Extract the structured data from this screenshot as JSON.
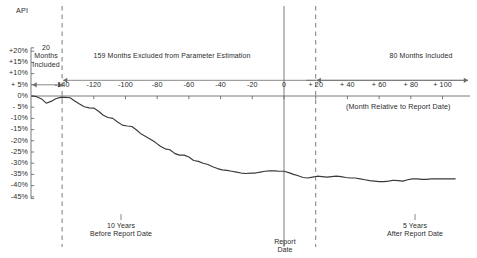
{
  "chart_data": {
    "type": "line",
    "title": "",
    "ylabel": "API",
    "xlabel": "(Month Relative to Report Date)",
    "grid": false,
    "legend_position": "none",
    "xlim": [
      -160,
      110
    ],
    "ylim": [
      -45,
      20
    ],
    "y_tick_labels": [
      "+20%",
      "+15%",
      "+10%",
      "+ 5%",
      "0%",
      "- 5%",
      "-10%",
      "-15%",
      "-20%",
      "-25%",
      "-30%",
      "-35%",
      "-40%",
      "-45%"
    ],
    "y_ticks": [
      20,
      15,
      10,
      5,
      0,
      -5,
      -10,
      -15,
      -20,
      -25,
      -30,
      -35,
      -40,
      -45
    ],
    "x_tick_labels": [
      "-140",
      "-120",
      "-100",
      "-80",
      "-60",
      "-40",
      "-20",
      "0",
      "+ 20",
      "+ 40",
      "+ 60",
      "+ 80",
      "+ 100"
    ],
    "x_ticks": [
      -140,
      -120,
      -100,
      -80,
      -60,
      -40,
      -20,
      0,
      20,
      40,
      60,
      80,
      100
    ],
    "annotations": [
      {
        "name": "months-included-left",
        "text": "20\nMonths\nIncluded",
        "x": -150,
        "y": 8
      },
      {
        "name": "months-excluded",
        "text": "159 Months Excluded from Parameter Estimation",
        "x": -60,
        "y": 7
      },
      {
        "name": "months-included-right",
        "text": "80 Months Included",
        "x": 62,
        "y": 7
      },
      {
        "name": "ten-years-before",
        "text": "10 Years\nBefore Report Date",
        "x": -122,
        "y": -41
      },
      {
        "name": "report-date",
        "text": "Report\nDate",
        "x": 0,
        "y": -46
      },
      {
        "name": "five-years-after",
        "text": "5 Years\nAfter Report Date",
        "x": 44,
        "y": -41
      }
    ],
    "vertical_markers": [
      {
        "name": "estimation-start-boundary",
        "x": -140,
        "style": "dashed"
      },
      {
        "name": "report-date-line",
        "x": 0,
        "style": "solid"
      },
      {
        "name": "estimation-end-boundary",
        "x": 20,
        "style": "dashed"
      }
    ],
    "series": [
      {
        "name": "API",
        "x": [
          -159,
          -156,
          -153,
          -150,
          -147,
          -144,
          -141,
          -138,
          -135,
          -132,
          -129,
          -126,
          -123,
          -120,
          -117,
          -114,
          -111,
          -108,
          -105,
          -102,
          -99,
          -96,
          -93,
          -90,
          -87,
          -84,
          -81,
          -78,
          -75,
          -72,
          -69,
          -66,
          -63,
          -60,
          -57,
          -54,
          -51,
          -48,
          -45,
          -42,
          -39,
          -36,
          -33,
          -30,
          -27,
          -24,
          -21,
          -18,
          -15,
          -12,
          -9,
          -6,
          -3,
          0,
          3,
          6,
          9,
          12,
          15,
          18,
          21,
          24,
          27,
          30,
          33,
          36,
          39,
          42,
          45,
          48,
          51,
          54,
          57,
          60,
          63,
          66,
          69,
          72,
          75,
          78,
          81,
          84,
          87,
          90,
          93,
          96,
          99,
          102,
          105,
          108
        ],
        "y": [
          0.0,
          -0.3,
          -1.3,
          -3.2,
          -2.4,
          -1.2,
          -0.6,
          -0.6,
          -0.8,
          -2.2,
          -3.6,
          -4.8,
          -5.3,
          -5.4,
          -6.8,
          -8.6,
          -9.6,
          -10.0,
          -11.6,
          -13.0,
          -13.4,
          -13.6,
          -15.2,
          -17.0,
          -18.2,
          -19.4,
          -20.8,
          -22.4,
          -23.6,
          -24.0,
          -25.6,
          -26.4,
          -26.4,
          -27.2,
          -28.8,
          -29.2,
          -30.0,
          -30.6,
          -31.6,
          -32.4,
          -33.0,
          -33.2,
          -33.6,
          -34.0,
          -34.4,
          -34.6,
          -34.4,
          -34.4,
          -34.0,
          -33.6,
          -33.4,
          -33.4,
          -33.6,
          -33.6,
          -34.2,
          -35.0,
          -35.6,
          -36.4,
          -36.6,
          -36.2,
          -35.8,
          -36.0,
          -36.2,
          -36.0,
          -35.8,
          -36.0,
          -36.4,
          -36.6,
          -36.6,
          -37.0,
          -37.4,
          -37.8,
          -38.0,
          -38.2,
          -38.2,
          -38.0,
          -37.6,
          -37.8,
          -38.0,
          -37.4,
          -37.0,
          -37.0,
          -37.2,
          -37.2,
          -37.0,
          -37.0,
          -37.0,
          -37.0,
          -37.0,
          -37.0
        ]
      }
    ]
  },
  "labels": {
    "y_axis_title": "API",
    "x_axis_caption": "(Month Relative to Report Date)",
    "note_left_line1": "20",
    "note_left_line2": "Months",
    "note_left_line3": "Included",
    "note_middle": "159 Months Excluded from Parameter Estimation",
    "note_right": "80 Months Included",
    "foot_left_line1": "10 Years",
    "foot_left_line2": "Before Report Date",
    "foot_mid_line1": "Report",
    "foot_mid_line2": "Date",
    "foot_right_line1": "5 Years",
    "foot_right_line2": "After Report Date"
  },
  "colors": {
    "line": "#3a3a3a",
    "axis": "#6b6b6b",
    "text": "#2b2b2b",
    "background": "#ffffff"
  }
}
